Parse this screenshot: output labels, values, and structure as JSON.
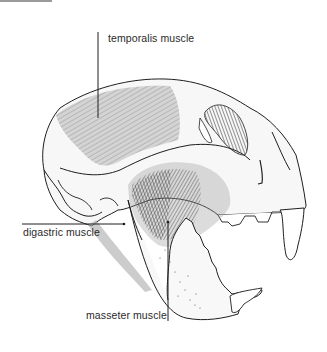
{
  "figure": {
    "labels": [
      {
        "id": "temporalis",
        "text": "temporalis muscle"
      },
      {
        "id": "digastric",
        "text": "digastric muscle"
      },
      {
        "id": "masseter",
        "text": "masseter muscle"
      }
    ]
  },
  "colors": {
    "line": "#1e1e1e",
    "muscle_shade": "#8c8c8c",
    "muscle_dark": "#4a4a4a",
    "bone_fill": "#f6f6f6"
  }
}
